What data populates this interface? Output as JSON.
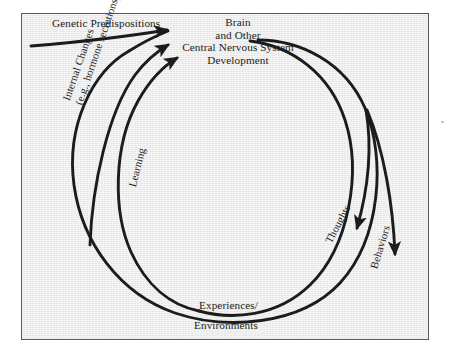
{
  "figure": {
    "type": "cyclical-feedback-diagram",
    "background_color": "#ededed",
    "border_color": "#5a5a5a",
    "ink_color": "#1c1c1c",
    "labels": {
      "genetic": "Genetic Predispositions",
      "brain_line1": "Brain",
      "brain_line2": "and Other",
      "brain_line3": "Central Nervous System",
      "brain_line4": "Development",
      "internal_line1": "Internal Changes",
      "internal_line2": "(e.g., hormone secretions)",
      "learning": "Learning",
      "thoughts": "Thoughts",
      "behaviors": "Behaviors",
      "experiences": "Experiences/",
      "environments": "Environments"
    },
    "nodes": [
      {
        "id": "genetic",
        "label": "Genetic Predispositions",
        "role": "external-input"
      },
      {
        "id": "brain",
        "label": "Brain and Other Central Nervous System Development",
        "role": "hub"
      },
      {
        "id": "experiences",
        "label": "Experiences/ Environments",
        "role": "hub"
      }
    ],
    "arrows": [
      {
        "id": "genetic-to-brain",
        "label": "Genetic Predispositions",
        "from": "genetic-predispositions",
        "to": "brain"
      },
      {
        "id": "internal-changes-to-brain",
        "label": "Internal Changes (e.g., hormone secretions)",
        "from": "internal-changes",
        "to": "brain"
      },
      {
        "id": "learning-to-brain",
        "label": "Learning",
        "from": "experiences",
        "to": "brain"
      },
      {
        "id": "brain-to-thoughts",
        "label": "Thoughts",
        "from": "brain",
        "to": "thoughts"
      },
      {
        "id": "brain-to-behaviors",
        "label": "Behaviors",
        "from": "brain",
        "to": "behaviors"
      },
      {
        "id": "brain-to-experiences",
        "label": "",
        "from": "brain",
        "to": "experiences"
      },
      {
        "id": "experiences-to-internal",
        "label": "",
        "from": "experiences",
        "to": "internal-changes"
      }
    ]
  }
}
